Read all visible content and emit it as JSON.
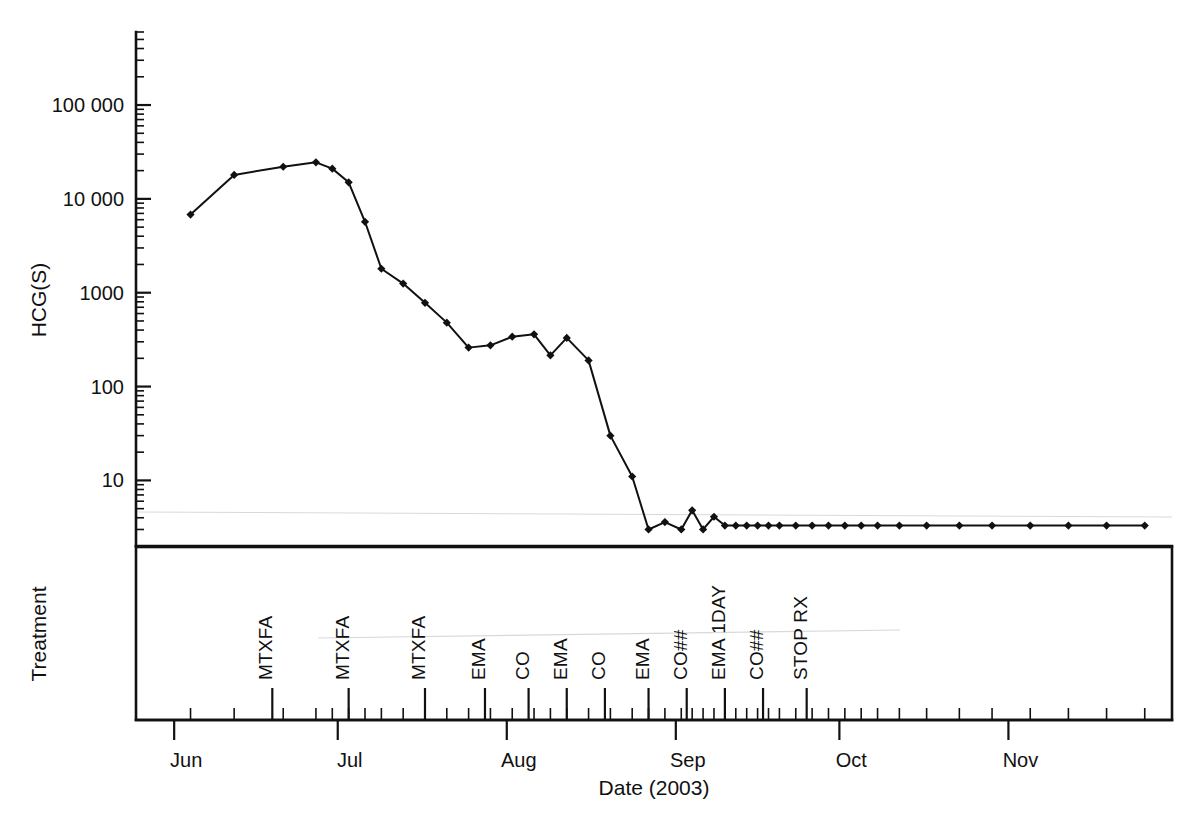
{
  "figure": {
    "background_color": "#ffffff",
    "ink_color": "#111111",
    "width": 1200,
    "height": 828
  },
  "chart_data": {
    "type": "line",
    "title": "",
    "subtitle": "",
    "xlabel": "Date (2003)",
    "ylabel": "HCG(S)",
    "secondary_panel_label": "Treatment",
    "yscale": "log",
    "ylim": [
      2,
      600000
    ],
    "ytick_labels": [
      "100 000",
      "10 000",
      "1000",
      "100",
      "10"
    ],
    "ytick_values": [
      100000,
      10000,
      1000,
      100,
      10
    ],
    "xtick_labels": [
      "Jun",
      "Jul",
      "Aug",
      "Sep",
      "Oct",
      "Nov"
    ],
    "xtick_values": [
      152,
      182,
      213,
      244,
      274,
      305
    ],
    "xlim": [
      145,
      335
    ],
    "grid": false,
    "legend": null,
    "marker": "filled-diamond",
    "series": [
      {
        "name": "HCG(S)",
        "x": [
          155,
          163,
          172,
          178,
          181,
          184,
          187,
          190,
          194,
          198,
          202,
          206,
          210,
          214,
          218,
          221,
          224,
          228,
          232,
          236,
          239,
          242,
          245,
          247,
          249,
          251,
          253,
          255,
          257,
          259,
          261,
          263,
          266,
          269,
          272,
          275,
          278,
          281,
          285,
          290,
          296,
          302,
          309,
          316,
          323,
          330
        ],
        "y": [
          6800,
          18000,
          22000,
          24500,
          21000,
          15000,
          5700,
          1800,
          1250,
          780,
          480,
          260,
          275,
          340,
          360,
          215,
          330,
          190,
          30,
          11,
          3.0,
          3.6,
          3.0,
          4.8,
          3.0,
          4.1,
          3.3,
          3.3,
          3.3,
          3.3,
          3.3,
          3.3,
          3.3,
          3.3,
          3.3,
          3.3,
          3.3,
          3.3,
          3.3,
          3.3,
          3.3,
          3.3,
          3.3,
          3.3,
          3.3,
          3.3
        ]
      }
    ],
    "treatments": [
      {
        "label": "MTXFA",
        "x": 170
      },
      {
        "label": "MTXFA",
        "x": 184
      },
      {
        "label": "MTXFA",
        "x": 198
      },
      {
        "label": "EMA",
        "x": 209
      },
      {
        "label": "CO",
        "x": 217
      },
      {
        "label": "EMA",
        "x": 224
      },
      {
        "label": "CO",
        "x": 231
      },
      {
        "label": "EMA",
        "x": 239
      },
      {
        "label": "CO##",
        "x": 246
      },
      {
        "label": "EMA 1DAY",
        "x": 253
      },
      {
        "label": "CO##",
        "x": 260
      },
      {
        "label": "STOP RX",
        "x": 268
      }
    ]
  },
  "axes": {
    "y_axis_title": "HCG(S)",
    "x_axis_title": "Date (2003)",
    "treatment_axis_title": "Treatment"
  }
}
